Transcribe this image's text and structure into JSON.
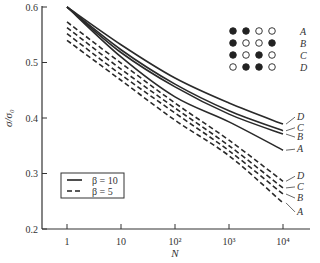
{
  "chart_data": {
    "type": "line",
    "title": "",
    "xlabel": "N",
    "ylabel": "σ/σ₀",
    "xscale": "log",
    "xlim": [
      1,
      10000
    ],
    "ylim": [
      0.2,
      0.6
    ],
    "x_ticks": [
      "1",
      "10",
      "10²",
      "10³",
      "10⁴"
    ],
    "y_ticks": [
      "0.2",
      "0.3",
      "0.4",
      "0.5",
      "0.6"
    ],
    "grid": false,
    "legend": {
      "position": "lower-left",
      "entries": [
        {
          "label": "β = 10",
          "style": "solid"
        },
        {
          "label": "β = 5",
          "style": "dashed"
        }
      ]
    },
    "x": [
      1,
      10,
      100,
      1000,
      10000
    ],
    "series": [
      {
        "name": "D",
        "beta": 10,
        "style": "solid",
        "values": [
          0.6,
          0.532,
          0.472,
          0.427,
          0.389
        ]
      },
      {
        "name": "C",
        "beta": 10,
        "style": "solid",
        "values": [
          0.6,
          0.523,
          0.461,
          0.413,
          0.377
        ]
      },
      {
        "name": "B",
        "beta": 10,
        "style": "solid",
        "values": [
          0.6,
          0.518,
          0.456,
          0.407,
          0.371
        ]
      },
      {
        "name": "A",
        "beta": 10,
        "style": "solid",
        "values": [
          0.6,
          0.51,
          0.438,
          0.393,
          0.342
        ]
      },
      {
        "name": "D",
        "beta": 5,
        "style": "dashed",
        "values": [
          0.573,
          0.499,
          0.427,
          0.36,
          0.286
        ]
      },
      {
        "name": "C",
        "beta": 5,
        "style": "dashed",
        "values": [
          0.563,
          0.488,
          0.418,
          0.35,
          0.274
        ]
      },
      {
        "name": "B",
        "beta": 5,
        "style": "dashed",
        "values": [
          0.552,
          0.478,
          0.409,
          0.341,
          0.263
        ]
      },
      {
        "name": "A",
        "beta": 5,
        "style": "dashed",
        "values": [
          0.54,
          0.468,
          0.396,
          0.332,
          0.247
        ]
      }
    ],
    "annotations": {
      "dot_patterns": [
        {
          "label": "A",
          "dots": [
            "filled",
            "filled",
            "open",
            "open"
          ]
        },
        {
          "label": "B",
          "dots": [
            "filled",
            "open",
            "open",
            "filled"
          ]
        },
        {
          "label": "C",
          "dots": [
            "filled",
            "open",
            "filled",
            "open"
          ]
        },
        {
          "label": "D",
          "dots": [
            "open",
            "filled",
            "filled",
            "open"
          ]
        }
      ]
    }
  }
}
